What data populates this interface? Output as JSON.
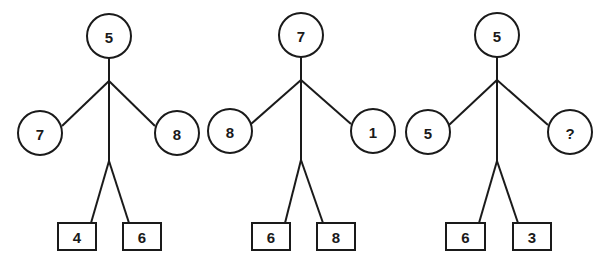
{
  "canvas": {
    "width": 604,
    "height": 264,
    "background": "#ffffff",
    "stroke_color": "#1a1a1a",
    "fill_color": "#ffffff"
  },
  "figures": [
    {
      "name": "figure-1",
      "root": {
        "label": "5",
        "shape": "circle",
        "cx": 109,
        "cy": 36,
        "r": 22
      },
      "left": {
        "label": "7",
        "shape": "circle",
        "cx": 40,
        "cy": 133,
        "r": 22
      },
      "right": {
        "label": "8",
        "shape": "circle",
        "cx": 177,
        "cy": 133,
        "r": 22
      },
      "box_left": {
        "label": "4",
        "shape": "rect",
        "x": 58,
        "y": 223,
        "w": 38,
        "h": 27
      },
      "box_right": {
        "label": "6",
        "shape": "rect",
        "x": 123,
        "y": 223,
        "w": 38,
        "h": 27
      },
      "stem_x": 109,
      "fork_top_y": 81,
      "fork_bottom_y": 161,
      "stem_start_y": 58,
      "left_attach_x": 62,
      "right_attach_x": 155,
      "attach_y": 126,
      "box_left_attach_x": 91,
      "box_right_attach_x": 129,
      "box_attach_y": 223
    },
    {
      "name": "figure-2",
      "root": {
        "label": "7",
        "shape": "circle",
        "cx": 301,
        "cy": 35,
        "r": 22
      },
      "left": {
        "label": "8",
        "shape": "circle",
        "cx": 230,
        "cy": 131,
        "r": 22
      },
      "right": {
        "label": "1",
        "shape": "circle",
        "cx": 373,
        "cy": 131,
        "r": 22
      },
      "box_left": {
        "label": "6",
        "shape": "rect",
        "x": 252,
        "y": 223,
        "w": 38,
        "h": 27
      },
      "box_right": {
        "label": "8",
        "shape": "rect",
        "x": 317,
        "y": 223,
        "w": 38,
        "h": 27
      },
      "stem_x": 301,
      "fork_top_y": 80,
      "fork_bottom_y": 160,
      "stem_start_y": 57,
      "left_attach_x": 251,
      "right_attach_x": 351,
      "attach_y": 124,
      "box_left_attach_x": 285,
      "box_right_attach_x": 323,
      "box_attach_y": 223
    },
    {
      "name": "figure-3",
      "root": {
        "label": "5",
        "shape": "circle",
        "cx": 497,
        "cy": 35,
        "r": 22
      },
      "left": {
        "label": "5",
        "shape": "circle",
        "cx": 428,
        "cy": 132,
        "r": 22
      },
      "right": {
        "label": "?",
        "shape": "circle",
        "cx": 570,
        "cy": 132,
        "r": 22
      },
      "box_left": {
        "label": "6",
        "shape": "rect",
        "x": 446,
        "y": 223,
        "w": 39,
        "h": 27
      },
      "box_right": {
        "label": "3",
        "shape": "rect",
        "x": 513,
        "y": 223,
        "w": 38,
        "h": 27
      },
      "stem_x": 497,
      "fork_top_y": 80,
      "fork_bottom_y": 161,
      "stem_start_y": 57,
      "left_attach_x": 449,
      "right_attach_x": 548,
      "attach_y": 125,
      "box_left_attach_x": 479,
      "box_right_attach_x": 518,
      "box_attach_y": 223
    }
  ],
  "chart_data": {
    "type": "diagram",
    "title": "",
    "items": [
      {
        "top": "5",
        "left": "7",
        "right": "8",
        "box_left": "4",
        "box_right": "6"
      },
      {
        "top": "7",
        "left": "8",
        "right": "1",
        "box_left": "6",
        "box_right": "8"
      },
      {
        "top": "5",
        "left": "5",
        "right": "?",
        "box_left": "6",
        "box_right": "3"
      }
    ]
  }
}
